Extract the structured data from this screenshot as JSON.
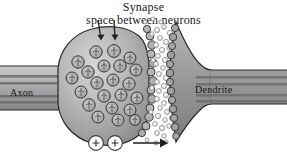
{
  "figure": {
    "title": "Synapse",
    "subtitle": "space between neurons",
    "background_color": "#ffffff",
    "labels": {
      "axon": "Axon",
      "dendrite": "Dendrite"
    },
    "annotations": {
      "charge_symbol": "+",
      "charge_count": 2,
      "direction_arrow": "→",
      "release_arrows": 2
    },
    "colors": {
      "membrane_outline": "#2b2b2b",
      "cytoplasm_light": "#cfcfcf",
      "cytoplasm_mid": "#a8a8a8",
      "cytoplasm_dark": "#8a8a8a",
      "dendrite_fill": "#9a9a9a",
      "vesicle_fill": "#b4b4b4",
      "vesicle_outline": "#3a3a3a",
      "neurotransmitter_fill": "#f2f2f2",
      "neurotransmitter_outline": "#6a6a6a",
      "cleft_fill": "#fbfbfb",
      "stripe_color": "#6f6f6f",
      "text_color": "#1a1a1a"
    },
    "counts": {
      "vesicles": 22,
      "neurotransmitters_in_cleft": 64,
      "axon_stripes": 4,
      "dendrite_stripes": 4
    }
  }
}
